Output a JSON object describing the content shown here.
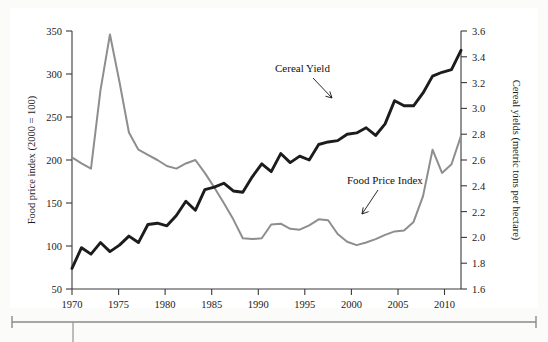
{
  "chart_data": {
    "type": "line",
    "title": "",
    "xlabel": "",
    "ylabel": "Food price index (2000 = 100)",
    "y2label": "Cereal yields (metric tons per hectare)",
    "xlim": [
      1970,
      2011
    ],
    "ylim": [
      50,
      350
    ],
    "y2lim": [
      1.6,
      3.6
    ],
    "grid": false,
    "legend_position": "inline-annotations",
    "x_ticks": [
      1970,
      1975,
      1980,
      1985,
      1990,
      1995,
      2000,
      2005,
      2010
    ],
    "y_ticks": [
      50,
      100,
      150,
      200,
      250,
      300,
      350
    ],
    "y2_ticks": [
      1.6,
      1.8,
      2.0,
      2.2,
      2.4,
      2.6,
      2.8,
      3.0,
      3.2,
      3.4,
      3.6
    ],
    "x": [
      1970,
      1971,
      1972,
      1973,
      1974,
      1975,
      1976,
      1977,
      1978,
      1979,
      1980,
      1981,
      1982,
      1983,
      1984,
      1985,
      1986,
      1987,
      1988,
      1989,
      1990,
      1991,
      1992,
      1993,
      1994,
      1995,
      1996,
      1997,
      1998,
      1999,
      2000,
      2001,
      2002,
      2003,
      2004,
      2005,
      2006,
      2007,
      2008,
      2009,
      2010,
      2011
    ],
    "series": [
      {
        "name": "Food Price Index",
        "axis": "left",
        "color": "#8e8e8e",
        "units": "index (2000 = 100)",
        "values": [
          203,
          196,
          190,
          281,
          346,
          291,
          232,
          212,
          206,
          200,
          193,
          190,
          196,
          200,
          185,
          168,
          150,
          131,
          109,
          108,
          109,
          125,
          126,
          120,
          119,
          124,
          131,
          130,
          114,
          105,
          101,
          104,
          108,
          113,
          117,
          118,
          128,
          158,
          212,
          185,
          195,
          228
        ]
      },
      {
        "name": "Cereal Yield",
        "axis": "right",
        "color": "#1c1c1c",
        "units": "metric tons per hectare",
        "values": [
          1.76,
          1.92,
          1.87,
          1.96,
          1.89,
          1.94,
          2.01,
          1.96,
          2.1,
          2.11,
          2.09,
          2.17,
          2.28,
          2.21,
          2.37,
          2.39,
          2.42,
          2.36,
          2.35,
          2.47,
          2.57,
          2.51,
          2.65,
          2.58,
          2.63,
          2.6,
          2.72,
          2.74,
          2.75,
          2.8,
          2.81,
          2.85,
          2.79,
          2.88,
          3.06,
          3.02,
          3.02,
          3.12,
          3.25,
          3.28,
          3.3,
          3.45
        ]
      }
    ],
    "annotations": [
      {
        "text": "Cereal Yield",
        "text_x": 1995.5,
        "text_y_axis": "right",
        "target_x": 1997.6,
        "target_value": 2.78
      },
      {
        "text": "Food Price Index",
        "text_x": 2002.0,
        "text_y_axis": "left",
        "target_x": 1998.6,
        "target_value": 116
      }
    ]
  },
  "axes": {
    "left_title": "Food price index (2000 = 100)",
    "right_title": "Cereal yields (metric tons per hectare)",
    "x_tick_labels": [
      "1970",
      "1975",
      "1980",
      "1985",
      "1990",
      "1995",
      "2000",
      "2005",
      "2010"
    ],
    "left_tick_labels": [
      "350",
      "300",
      "250",
      "200",
      "150",
      "100",
      "50"
    ],
    "right_tick_labels": [
      "3.6",
      "3.4",
      "3.2",
      "3.0",
      "2.8",
      "2.6",
      "2.4",
      "2.2",
      "2.0",
      "1.8",
      "1.6"
    ]
  },
  "labels": {
    "cereal_yield": "Cereal Yield",
    "food_price_index": "Food Price Index"
  },
  "colors": {
    "yield_line": "#1c1c1c",
    "fpi_line": "#8e8e8e",
    "axis": "#3a3a3a",
    "page_background": "#fbfbfa",
    "figure_background": "#ffffff",
    "rule": "#8a8a8a"
  }
}
